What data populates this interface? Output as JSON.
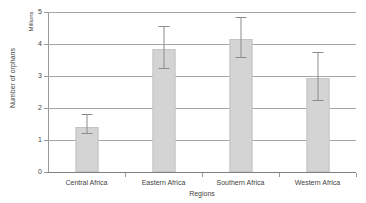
{
  "chart_data": {
    "type": "bar",
    "title": "",
    "subtitle": "",
    "xlabel": "Regions",
    "ylabel": "Number of orphans",
    "yunit": "Millions",
    "categories": [
      "Central Africa",
      "Eastern Africa",
      "Southern Africa",
      "Western Africa"
    ],
    "values": [
      1.4,
      3.85,
      4.15,
      2.93
    ],
    "error_low": [
      1.2,
      3.22,
      3.55,
      2.22
    ],
    "error_high": [
      1.8,
      4.55,
      4.85,
      3.75
    ],
    "ylim": [
      0,
      5
    ],
    "yticks": [
      0,
      1,
      2,
      3,
      4,
      5
    ],
    "ytick_labels": [
      "0",
      "1",
      "2",
      "3",
      "4",
      "5"
    ],
    "grid": true,
    "legend": "none",
    "series": [
      {
        "name": "Number of orphans",
        "values": [
          1.4,
          3.85,
          4.15,
          2.93
        ]
      }
    ],
    "colors": {
      "bar_fill": "#d4d4d4",
      "bar_border": "#c4c4c4",
      "gridline": "#a6a6a6",
      "axis": "#9a9a9a",
      "error_bar": "#8c8c8c",
      "text": "#3f3f3f",
      "background": "#ffffff"
    }
  }
}
